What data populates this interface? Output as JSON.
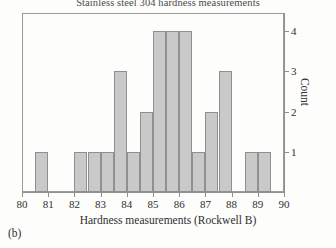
{
  "figure": {
    "panel_label": "(b)",
    "background_color": "#fdfdfc",
    "frame_color": "#9a9a9a"
  },
  "chart_data": {
    "type": "bar",
    "title": "Stainless steel 304 hardness measurements",
    "xlabel": "Hardness measurements (Rockwell B)",
    "ylabel": "Count",
    "xlim": [
      80,
      90
    ],
    "ylim": [
      0,
      4.45
    ],
    "grid": false,
    "legend": null,
    "bin_width": 0.5,
    "bar_fill_color": "#c9c9c9",
    "bar_edge_color": "#8f8f8f",
    "xticks": [
      80,
      81,
      82,
      83,
      84,
      85,
      86,
      87,
      88,
      89,
      90
    ],
    "xtick_labels": [
      "80",
      "81",
      "82",
      "83",
      "84",
      "85",
      "86",
      "87",
      "88",
      "89",
      "90"
    ],
    "yticks": [
      1,
      2,
      3,
      4
    ],
    "ytick_labels": [
      "1",
      "2",
      "3",
      "4"
    ],
    "yaxis_position": "right",
    "bins": [
      {
        "start": 80.5,
        "end": 81.0,
        "count": 1
      },
      {
        "start": 82.0,
        "end": 82.5,
        "count": 1
      },
      {
        "start": 82.5,
        "end": 83.0,
        "count": 1
      },
      {
        "start": 83.0,
        "end": 83.5,
        "count": 1
      },
      {
        "start": 83.5,
        "end": 84.0,
        "count": 3
      },
      {
        "start": 84.0,
        "end": 84.5,
        "count": 1
      },
      {
        "start": 84.5,
        "end": 85.0,
        "count": 2
      },
      {
        "start": 85.0,
        "end": 85.5,
        "count": 4
      },
      {
        "start": 85.5,
        "end": 86.0,
        "count": 4
      },
      {
        "start": 86.0,
        "end": 86.5,
        "count": 4
      },
      {
        "start": 86.5,
        "end": 87.0,
        "count": 1
      },
      {
        "start": 87.0,
        "end": 87.5,
        "count": 2
      },
      {
        "start": 87.5,
        "end": 88.0,
        "count": 3
      },
      {
        "start": 88.5,
        "end": 89.0,
        "count": 1
      },
      {
        "start": 89.0,
        "end": 89.5,
        "count": 1
      }
    ],
    "categories": [
      "80.5-81.0",
      "82.0-82.5",
      "82.5-83.0",
      "83.0-83.5",
      "83.5-84.0",
      "84.0-84.5",
      "84.5-85.0",
      "85.0-85.5",
      "85.5-86.0",
      "86.0-86.5",
      "86.5-87.0",
      "87.0-87.5",
      "87.5-88.0",
      "88.5-89.0",
      "89.0-89.5"
    ],
    "values": [
      1,
      1,
      1,
      1,
      3,
      1,
      2,
      4,
      4,
      4,
      1,
      2,
      3,
      1,
      1
    ],
    "total_count": 30
  }
}
